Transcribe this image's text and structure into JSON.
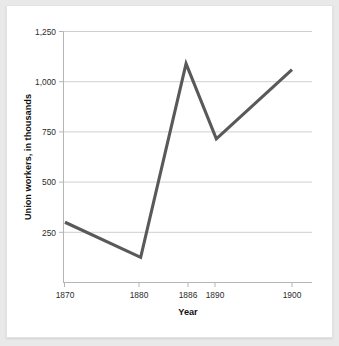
{
  "chart_data": {
    "type": "line",
    "title": "",
    "xlabel": "Year",
    "ylabel": "Union workers, in thousands",
    "x": [
      1870,
      1880,
      1886,
      1890,
      1900
    ],
    "values": [
      300,
      125,
      1090,
      715,
      1060
    ],
    "series": [
      {
        "name": "Union workers",
        "values": [
          300,
          125,
          1090,
          715,
          1060
        ]
      }
    ],
    "categories": [
      "1870",
      "1880",
      "1886",
      "1890",
      "1900"
    ],
    "xtick_labels": [
      "1870",
      "1880",
      "1886",
      "1890",
      "1900"
    ],
    "ytick_labels": [
      "250",
      "500",
      "750",
      "1,000",
      "1,250"
    ],
    "ytick_values": [
      250,
      500,
      750,
      1000,
      1250
    ],
    "ylim": [
      0,
      1250
    ],
    "xlim": [
      1867,
      1903
    ],
    "grid": "horizontal",
    "legend": "none",
    "line_color": "#595959",
    "grid_color": "#c9c9c9",
    "background_color": "#ffffff",
    "page_background_color": "#e9e9e9"
  }
}
